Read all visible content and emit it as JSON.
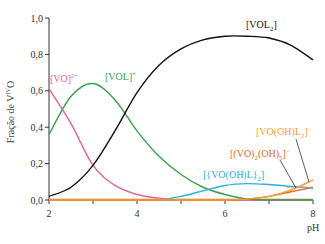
{
  "chart_data": {
    "type": "line",
    "title": "",
    "xlabel": "pH",
    "ylabel": "Fração de V^IV O",
    "xlim": [
      2,
      8
    ],
    "ylim": [
      0,
      1.0
    ],
    "x_ticks": [
      "2",
      "4",
      "6",
      "8"
    ],
    "x_minor_ticks": [
      3,
      5,
      7
    ],
    "y_ticks": [
      "0,0",
      "0,2",
      "0,4",
      "0,6",
      "0,8",
      "1,0"
    ],
    "grid": false,
    "legend": "inline labels",
    "x": [
      2.0,
      2.5,
      3.0,
      3.5,
      4.0,
      4.5,
      5.0,
      5.5,
      6.0,
      6.5,
      7.0,
      7.5,
      8.0
    ],
    "series": [
      {
        "name": "[VO]2+",
        "label": "[VO]²⁺",
        "color": "#e8609a",
        "values": [
          0.61,
          0.42,
          0.19,
          0.08,
          0.03,
          0.01,
          0.0,
          0.0,
          0.0,
          0.0,
          0.0,
          0.0,
          0.0
        ]
      },
      {
        "name": "[VOL]+",
        "label": "[VOL]⁺",
        "color": "#3aa04a",
        "values": [
          0.36,
          0.57,
          0.64,
          0.55,
          0.38,
          0.24,
          0.14,
          0.07,
          0.03,
          0.005,
          0.0,
          0.0,
          0.0
        ]
      },
      {
        "name": "[VOL2]",
        "label": "[VOL₂]",
        "color": "#111111",
        "values": [
          0.02,
          0.07,
          0.19,
          0.38,
          0.59,
          0.74,
          0.83,
          0.88,
          0.9,
          0.9,
          0.89,
          0.85,
          0.77
        ]
      },
      {
        "name": "[{VO(OH)L}2]",
        "label": "[{VO(OH)L}₂]",
        "color": "#2ab0e0",
        "values": [
          0.0,
          0.0,
          0.0,
          0.0,
          0.0,
          0.0,
          0.02,
          0.05,
          0.08,
          0.09,
          0.085,
          0.075,
          0.065
        ]
      },
      {
        "name": "[(VO)2(OH)5]-",
        "label": "[(VO)₂(OH)₅]⁻",
        "color": "#e06a20",
        "values": [
          0.0,
          0.0,
          0.0,
          0.0,
          0.0,
          0.0,
          0.0,
          0.0,
          0.0,
          0.005,
          0.02,
          0.045,
          0.07
        ]
      },
      {
        "name": "[VO(OH)L2]-",
        "label": "[VO(OH)L₂]⁻",
        "color": "#f5a030",
        "values": [
          0.0,
          0.0,
          0.0,
          0.0,
          0.0,
          0.0,
          0.0,
          0.0,
          0.0,
          0.005,
          0.02,
          0.055,
          0.11
        ]
      }
    ]
  },
  "labels": {
    "ylabel_main": "Fração de V",
    "ylabel_sup": "IV",
    "ylabel_end": "O",
    "xlabel": "pH",
    "vo2": "[VO]",
    "vo2_sup": "2+",
    "vol": "[VOL]",
    "vol_sup": "+",
    "vol2": "[VOL",
    "vol2_sub": "2",
    "vol2_end": "]",
    "dimer": "[{VO(OH)L}",
    "dimer_sub": "2",
    "dimer_end": "]",
    "vo2oh5_a": "[(VO)",
    "vo2oh5_sub1": "2",
    "vo2oh5_b": "(OH)",
    "vo2oh5_sub2": "5",
    "vo2oh5_c": "]",
    "vo2oh5_sup": "−",
    "vooh_a": "[VO(OH)L",
    "vooh_sub": "2",
    "vooh_b": "]",
    "vooh_sup": "−"
  }
}
